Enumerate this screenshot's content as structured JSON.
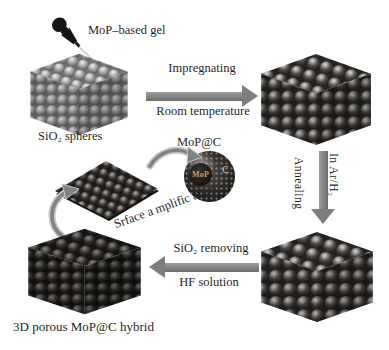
{
  "steps": {
    "gel_label": "MoP–based gel",
    "sio2_label": "SiO₂ spheres",
    "impregnating_top": "Impregnating",
    "impregnating_bottom": "Room temperature",
    "annealing_left": "Annealing",
    "annealing_right": "In Ar/H₂",
    "removing_top": "SiO₂ removing",
    "removing_bottom": "HF solution",
    "mopc_label": "MoP@C",
    "sphere_core_label": "MoP",
    "sphere_shell_label": "C",
    "amplification_label": "Srface a mplific ation",
    "hybrid_label": "3D porous MoP@C hybrid"
  },
  "colors": {
    "background": "#ffffff",
    "text": "#1f1f1f",
    "arrow_gray": "#7e7e7e",
    "sio2_sphere": "#9e9e9e",
    "impregnated_sphere": "#4c4845",
    "porous_sphere": "#312e2b",
    "dropper_black": "#141414",
    "core_text": "#c9976b"
  }
}
